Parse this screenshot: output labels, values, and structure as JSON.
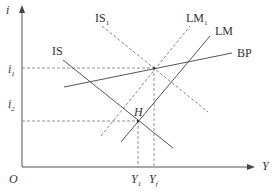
{
  "diagram": {
    "type": "IS-LM-BP",
    "axes": {
      "y_label": "i",
      "x_label": "Y",
      "origin_label": "O"
    },
    "curves": [
      {
        "id": "IS",
        "label": "IS",
        "style": "solid"
      },
      {
        "id": "IS1",
        "label": "IS",
        "sub": "1",
        "style": "dashed"
      },
      {
        "id": "LM",
        "label": "LM",
        "style": "solid"
      },
      {
        "id": "LM1",
        "label": "LM",
        "sub": "1",
        "style": "dashed"
      },
      {
        "id": "BP",
        "label": "BP",
        "style": "solid"
      }
    ],
    "points": [
      {
        "id": "H",
        "label": "H"
      }
    ],
    "y_ticks": [
      {
        "label": "i",
        "sub": "1"
      },
      {
        "label": "i",
        "sub": "2"
      }
    ],
    "x_ticks": [
      {
        "label": "Y",
        "sub": "1"
      },
      {
        "label": "Y",
        "sub": "f"
      }
    ],
    "colors": {
      "line": "#555555",
      "dashed": "#777777",
      "text": "#333333"
    }
  }
}
